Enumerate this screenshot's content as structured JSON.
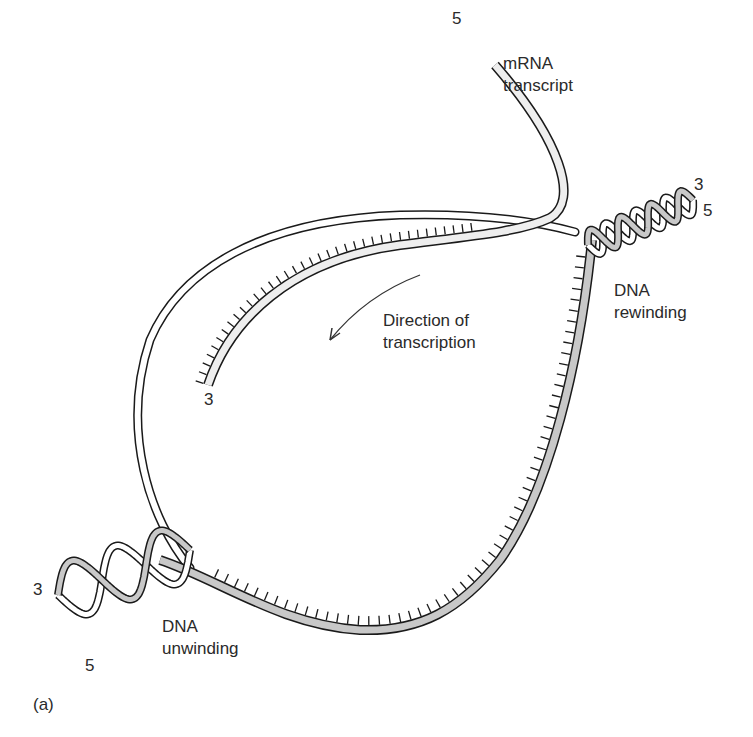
{
  "figure": {
    "panel_label": "(a)",
    "labels": {
      "mrna_line1": "mRNA",
      "mrna_line2": "transcript",
      "mrna_5prime": "5",
      "mrna_3prime": "3",
      "direction_line1": "Direction of",
      "direction_line2": "transcription",
      "rewinding_line1": "DNA",
      "rewinding_line2": "rewinding",
      "rewinding_3prime": "3",
      "rewinding_5prime": "5",
      "unwinding_line1": "DNA",
      "unwinding_line2": "unwinding",
      "unwinding_3prime": "3",
      "unwinding_5prime": "5"
    },
    "colors": {
      "ink": "#1a1a1a",
      "coding_strand": "#ffffff",
      "template_strand": "#c8c8c8",
      "mrna": "#eeeeee"
    }
  }
}
